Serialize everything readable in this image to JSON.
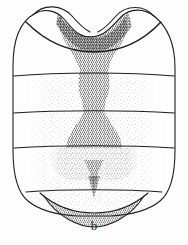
{
  "figure": {
    "label": "b",
    "kind": "scientific-illustration",
    "background_color": "#fdfdfd",
    "ink_color": "#1d1d1d",
    "outline_width_px": 1.1
  },
  "caption": {
    "text": "b",
    "position": "bottom-center"
  },
  "shading": {
    "dark_stipple_color": "#3a3a3a",
    "mid_stipple_color": "#6b6b6b",
    "light_stipple_color": "#9a9a9a",
    "dark_density_pct": 48,
    "mid_density_pct": 22,
    "light_density_pct": 9
  },
  "structures": [
    {
      "name": "anterior-left-lobe",
      "label": "left humeral lobe",
      "shaded": false
    },
    {
      "name": "anterior-right-lobe",
      "label": "right humeral lobe",
      "shaded": false
    },
    {
      "name": "anterior-median-notch",
      "label": "median anterior emargination",
      "shaded": true
    },
    {
      "name": "median-dark-band",
      "label": "median longitudinal dark band",
      "shaded": true
    },
    {
      "name": "body-outline",
      "label": "body margin",
      "shaded": false
    },
    {
      "name": "terminal-cap",
      "label": "terminal apical lobe",
      "shaded": true
    }
  ],
  "segment_lines": [
    {
      "name": "transverse-suture-1",
      "y": 76
    },
    {
      "name": "transverse-suture-2",
      "y": 113
    },
    {
      "name": "transverse-suture-3",
      "y": 148
    },
    {
      "name": "transverse-suture-4",
      "y": 192
    }
  ],
  "geometry": {
    "canvas_width": 188,
    "canvas_height": 245,
    "body_left_x": 13,
    "body_right_x": 175,
    "body_top_y": 6,
    "body_bottom_y": 213
  }
}
